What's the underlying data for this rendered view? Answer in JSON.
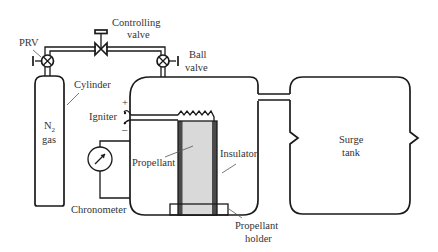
{
  "diagram": {
    "labels": {
      "prv": "PRV",
      "controlling_valve_line1": "Controlling",
      "controlling_valve_line2": "valve",
      "ball_valve_line1": "Ball",
      "ball_valve_line2": "valve",
      "cylinder": "Cylinder",
      "gas_line1": "N",
      "gas_subscript": "2",
      "gas_line2": "gas",
      "igniter": "Igniter",
      "igniter_plus": "+",
      "igniter_minus": "–",
      "propellant": "Propellant",
      "insulator": "Insulator",
      "chronometer": "Chronometer",
      "holder_line1": "Propellant",
      "holder_line2": "holder",
      "surge_line1": "Surge",
      "surge_line2": "tank"
    },
    "colors": {
      "stroke": "#1a1a1a",
      "propellant_fill": "#d9d9d9",
      "insulator_fill": "#4a4a4a",
      "text": "#333333"
    }
  }
}
